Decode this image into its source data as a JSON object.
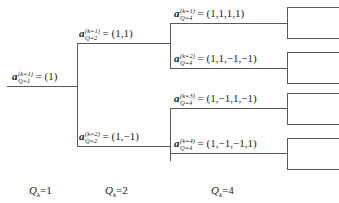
{
  "diagram": {
    "type": "tree",
    "root": {
      "var": "a",
      "sup": "(k=1)",
      "sub": "Q=1",
      "value": "(1)"
    },
    "level2": [
      {
        "var": "a",
        "sup": "(k=1)",
        "sub": "Q=2",
        "value": "(1,1)"
      },
      {
        "var": "a",
        "sup": "(k=2)",
        "sub": "Q=2",
        "value": "(1,−1)"
      }
    ],
    "level3": [
      {
        "var": "a",
        "sup": "(k=1)",
        "sub": "Q=4",
        "value": "(1,1,1,1)"
      },
      {
        "var": "a",
        "sup": "(k=2)",
        "sub": "Q=4",
        "value": "(1,1,−1,−1)"
      },
      {
        "var": "a",
        "sup": "(k=3)",
        "sub": "Q=4",
        "value": "(1,−1,1,−1)"
      },
      {
        "var": "a",
        "sup": "(k=4)",
        "sub": "Q=4",
        "value": "(1,−1,−1,1)"
      }
    ],
    "axis_labels": [
      {
        "q": "Q",
        "sub": "k",
        "value": "=1"
      },
      {
        "q": "Q",
        "sub": "k",
        "value": "=2"
      },
      {
        "q": "Q",
        "sub": "k",
        "value": "=4"
      }
    ],
    "eq": "="
  }
}
